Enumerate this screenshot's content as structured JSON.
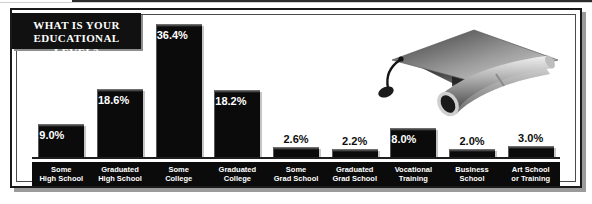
{
  "title": {
    "line1": "WHAT IS YOUR",
    "line2": "EDUCATIONAL LEVEL?"
  },
  "illustration": {
    "cap_name": "graduation-cap-icon",
    "diploma_name": "diploma-scroll-icon"
  },
  "colors": {
    "bar": "#0b0b0b",
    "plaque": "#111111",
    "label_strip": "#0b0b0b",
    "frame": "#1a1a1a",
    "shadow": "#9b9b9b",
    "value_text_outside": "#0d0d0d",
    "value_text_inside": "#ffffff"
  },
  "chart_data": {
    "type": "bar",
    "title": "WHAT IS YOUR EDUCATIONAL LEVEL?",
    "xlabel": "",
    "ylabel": "",
    "ylim": [
      0,
      36.4
    ],
    "grid": false,
    "legend": false,
    "categories": [
      "Some High School",
      "Graduated High School",
      "Some College",
      "Graduated College",
      "Some Grad School",
      "Graduated Grad School",
      "Vocational Training",
      "Business School",
      "Art School or Training"
    ],
    "values": [
      9.0,
      18.6,
      36.4,
      18.2,
      2.6,
      2.2,
      8.0,
      2.0,
      3.0
    ],
    "value_labels": [
      "9.0%",
      "18.6%",
      "36.4%",
      "18.2%",
      "2.6%",
      "2.2%",
      "8.0%",
      "2.0%",
      "3.0%"
    ]
  },
  "bars": [
    {
      "label_line1": "Some",
      "label_line2": "High School",
      "value": "9.0%",
      "inside": true
    },
    {
      "label_line1": "Graduated",
      "label_line2": "High School",
      "value": "18.6%",
      "inside": true
    },
    {
      "label_line1": "Some",
      "label_line2": "College",
      "value": "36.4%",
      "inside": true
    },
    {
      "label_line1": "Graduated",
      "label_line2": "College",
      "value": "18.2%",
      "inside": true
    },
    {
      "label_line1": "Some",
      "label_line2": "Grad School",
      "value": "2.6%",
      "inside": false
    },
    {
      "label_line1": "Graduated",
      "label_line2": "Grad School",
      "value": "2.2%",
      "inside": false
    },
    {
      "label_line1": "Vocational",
      "label_line2": "Training",
      "value": "8.0%",
      "inside": true
    },
    {
      "label_line1": "Business",
      "label_line2": "School",
      "value": "2.0%",
      "inside": false
    },
    {
      "label_line1": "Art School",
      "label_line2": "or Training",
      "value": "3.0%",
      "inside": false
    }
  ]
}
